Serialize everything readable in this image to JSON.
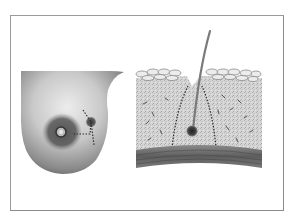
{
  "figure": {
    "panels": [
      {
        "id": "breast-external-view",
        "depicts": "breast with nipple-areola and dotted localization path to a lesion"
      },
      {
        "id": "tissue-cross-section",
        "depicts": "skin cross-section with localization wire descending to a lesion, dotted excision margin"
      }
    ]
  },
  "colors": {
    "frame": "#9a9a9a",
    "skin_light": "#e6e6e6",
    "skin_dark": "#5a5a5a",
    "areola": "#3e3e3e",
    "tissue": "#cfcfcf",
    "fascia": "#6c6c6c",
    "wire": "#7a7a7a",
    "lesion": "#2c2c2c"
  }
}
